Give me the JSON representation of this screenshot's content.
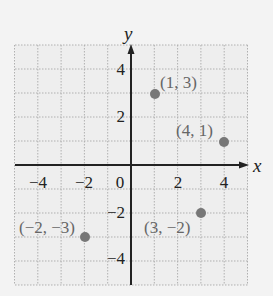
{
  "chart_data": {
    "type": "scatter",
    "title": "",
    "xlabel": "x",
    "ylabel": "y",
    "xlim": [
      -5,
      5
    ],
    "ylim": [
      -5,
      5
    ],
    "grid": true,
    "x_ticks": [
      "-4",
      "-2",
      "0",
      "2",
      "4"
    ],
    "y_ticks": [
      "4",
      "2",
      "-2",
      "-4"
    ],
    "points": [
      {
        "x": 1,
        "y": 3,
        "label": "(1, 3)"
      },
      {
        "x": 4,
        "y": 1,
        "label": "(4, 1)"
      },
      {
        "x": -2,
        "y": -3,
        "label": "(−2, −3)"
      },
      {
        "x": 3,
        "y": -2,
        "label": "(3, −2)"
      }
    ],
    "colors": {
      "point": "#777777",
      "axis": "#222222",
      "grid": "#b5b5b5",
      "background": "#f3f3f3"
    }
  },
  "labels": {
    "x_axis": "x",
    "y_axis": "y",
    "xt": [
      "−4",
      "−2",
      "0",
      "2",
      "4"
    ],
    "yt": [
      "4",
      "2",
      "−2",
      "−4"
    ],
    "p0": "(1, 3)",
    "p1": "(4, 1)",
    "p2": "(−2, −3)",
    "p3": "(3, −2)"
  }
}
